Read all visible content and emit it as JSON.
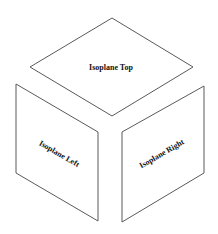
{
  "diagram": {
    "type": "isometric-cube-isoplanes",
    "faces": [
      {
        "id": "top",
        "label": "Isoplane Top"
      },
      {
        "id": "left",
        "label": "Isoplane Left"
      },
      {
        "id": "right",
        "label": "Isoplane Right"
      }
    ]
  },
  "colors": {
    "outline": "#5a5a5a",
    "text": "#111111",
    "background": "#ffffff"
  }
}
